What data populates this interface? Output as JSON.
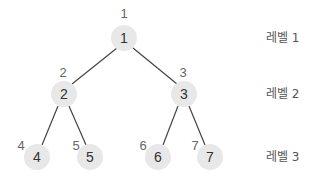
{
  "diagram": {
    "title": "",
    "colors": {
      "node_fill": "#e8e8e8",
      "edge": "#444444",
      "node_text": "#333333",
      "index_text": "#666666"
    },
    "nodes": [
      {
        "id": "1",
        "label": "1",
        "index": "1",
        "level": 1
      },
      {
        "id": "2",
        "label": "2",
        "index": "2",
        "level": 2
      },
      {
        "id": "3",
        "label": "3",
        "index": "3",
        "level": 2
      },
      {
        "id": "4",
        "label": "4",
        "index": "4",
        "level": 3
      },
      {
        "id": "5",
        "label": "5",
        "index": "5",
        "level": 3
      },
      {
        "id": "6",
        "label": "6",
        "index": "6",
        "level": 3
      },
      {
        "id": "7",
        "label": "7",
        "index": "7",
        "level": 3
      }
    ],
    "edges": [
      {
        "from": "1",
        "to": "2"
      },
      {
        "from": "1",
        "to": "3"
      },
      {
        "from": "2",
        "to": "4"
      },
      {
        "from": "2",
        "to": "5"
      },
      {
        "from": "3",
        "to": "6"
      },
      {
        "from": "3",
        "to": "7"
      }
    ],
    "levels": [
      {
        "label": "레벨 1"
      },
      {
        "label": "레벨 2"
      },
      {
        "label": "레벨 3"
      }
    ]
  }
}
